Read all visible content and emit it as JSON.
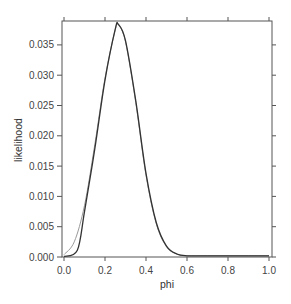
{
  "chart_data": {
    "type": "line",
    "title": "",
    "xlabel": "phi",
    "ylabel": "likelihood",
    "xlim": [
      0.0,
      1.0
    ],
    "ylim": [
      0.0,
      0.0385
    ],
    "grid": false,
    "legend": null,
    "x_ticks": [
      "0.0",
      "0.2",
      "0.4",
      "0.6",
      "0.8",
      "1.0"
    ],
    "y_ticks": [
      "0.000",
      "0.005",
      "0.010",
      "0.015",
      "0.020",
      "0.025",
      "0.030",
      "0.035"
    ],
    "series": [
      {
        "name": "likelihood (approximation, light)",
        "color": "#9a9a9a",
        "x": [
          0.0,
          0.05,
          0.1,
          0.15,
          0.2,
          0.25,
          0.265,
          0.3,
          0.35,
          0.4,
          0.45,
          0.5,
          0.55,
          0.6,
          0.7,
          0.8,
          0.9,
          1.0
        ],
        "y": [
          0.0004,
          0.0025,
          0.0085,
          0.0185,
          0.0295,
          0.0375,
          0.0383,
          0.0355,
          0.0255,
          0.0135,
          0.0055,
          0.0017,
          0.0005,
          0.0002,
          0.0002,
          0.0002,
          0.0002,
          0.0002
        ]
      },
      {
        "name": "likelihood (exact, dark)",
        "color": "#333333",
        "x": [
          0.0,
          0.065,
          0.1,
          0.15,
          0.2,
          0.25,
          0.265,
          0.3,
          0.35,
          0.4,
          0.45,
          0.5,
          0.55,
          0.6,
          0.7,
          0.8,
          0.9,
          1.0
        ],
        "y": [
          0.0001,
          0.0011,
          0.0075,
          0.0178,
          0.0292,
          0.0376,
          0.0384,
          0.0357,
          0.0258,
          0.0138,
          0.0057,
          0.0018,
          0.0005,
          0.0002,
          0.0002,
          0.0002,
          0.0002,
          0.0002
        ]
      }
    ]
  }
}
